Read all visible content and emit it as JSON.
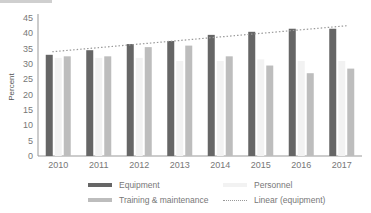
{
  "chart_data": {
    "type": "bar",
    "title": "",
    "xlabel": "",
    "ylabel": "Percent",
    "ylim": [
      0,
      45
    ],
    "yticks": [
      0,
      5,
      10,
      15,
      20,
      25,
      30,
      35,
      40,
      45
    ],
    "grid": false,
    "legend_position": "bottom",
    "categories": [
      "2010",
      "2011",
      "2012",
      "2013",
      "2014",
      "2015",
      "2016",
      "2017"
    ],
    "series": [
      {
        "name": "Equipment",
        "color": "#666666",
        "values": [
          33,
          34.5,
          36.5,
          37.5,
          39.5,
          40.5,
          41.5,
          41.5
        ]
      },
      {
        "name": "Personnel",
        "color": "#f2f2f2",
        "values": [
          32,
          32,
          32,
          31,
          31,
          31.5,
          31,
          31
        ]
      },
      {
        "name": "Training & maintenance",
        "color": "#bdbdbd",
        "values": [
          32.5,
          32.5,
          35.5,
          36,
          32.5,
          29.5,
          27,
          28.5
        ]
      }
    ],
    "trendline": {
      "name": "Linear (equipment)",
      "style": "dotted",
      "color": "#999999",
      "start": 34,
      "end": 42.5
    }
  },
  "legend": {
    "equipment": "Equipment",
    "personnel": "Personnel",
    "training": "Training & maintenance",
    "linear": "Linear (equipment)"
  }
}
